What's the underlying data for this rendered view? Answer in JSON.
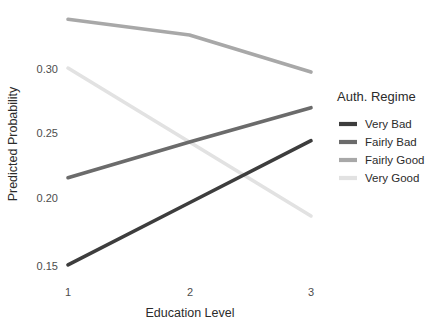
{
  "chart_data": {
    "type": "line",
    "title": "",
    "subtitle": "",
    "xlabel": "Education Level",
    "ylabel": "Predicted Probability",
    "x": [
      1,
      2,
      3
    ],
    "xticklabels": [
      "1",
      "2",
      "3"
    ],
    "yticks": [
      0.15,
      0.2,
      0.25,
      0.3
    ],
    "yticklabels": [
      "0.15",
      "0.20",
      "0.25",
      "0.30"
    ],
    "xlim": [
      0.85,
      3.15
    ],
    "ylim": [
      0.1395,
      0.3455
    ],
    "grid": false,
    "legend": {
      "title": "Auth. Regime",
      "position": "right",
      "entries": [
        "Very Bad",
        "Fairly Bad",
        "Fairly Good",
        "Very Good"
      ]
    },
    "series": [
      {
        "name": "Very Bad",
        "color": "#3d3d3d",
        "values": [
          0.151,
          0.198,
          0.245
        ]
      },
      {
        "name": "Fairly Bad",
        "color": "#6b6b6b",
        "values": [
          0.217,
          0.244,
          0.27
        ]
      },
      {
        "name": "Fairly Good",
        "color": "#a8a8a8",
        "values": [
          0.337,
          0.325,
          0.297
        ]
      },
      {
        "name": "Very Good",
        "color": "#e2e2e2",
        "values": [
          0.3,
          0.244,
          0.188
        ]
      }
    ]
  },
  "axes": {
    "y_title": "Predicted Probability",
    "x_title": "Education Level",
    "y_tick_0": "0.30",
    "y_tick_1": "0.25",
    "y_tick_2": "0.20",
    "y_tick_3": "0.15",
    "x_tick_0": "1",
    "x_tick_1": "2",
    "x_tick_2": "3"
  },
  "legend": {
    "title": "Auth. Regime",
    "item_0": "Very Bad",
    "item_1": "Fairly Bad",
    "item_2": "Fairly Good",
    "item_3": "Very Good"
  }
}
